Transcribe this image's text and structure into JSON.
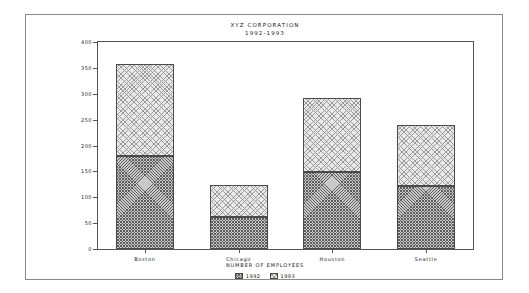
{
  "chart_data": {
    "type": "bar",
    "subtype": "stacked-vertical-bar",
    "title": "XYZ CORPORATION",
    "subtitle": "1992-1993",
    "xlabel": "NUMBER OF EMPLOYEES",
    "ylabel": "",
    "categories": [
      "Boston",
      "Chicago",
      "Houston",
      "Seattle"
    ],
    "series": [
      {
        "name": "1992",
        "values": [
          180,
          62,
          148,
          122
        ],
        "fill": "dense-crosshatch",
        "color": "#c9c9c9"
      },
      {
        "name": "1993",
        "values": [
          177,
          62,
          144,
          118
        ],
        "fill": "light-crosshatch",
        "color": "#e9e9e9"
      }
    ],
    "totals": [
      357,
      124,
      292,
      240
    ],
    "ylim": [
      0,
      400
    ],
    "yticks": [
      0,
      50,
      100,
      150,
      200,
      250,
      300,
      350,
      400
    ],
    "ytick_labels": [
      "0",
      "50",
      "100",
      "150",
      "200",
      "250",
      "300",
      "350",
      "400"
    ],
    "grid": false,
    "legend_position": "bottom-center",
    "legend_entries": [
      "1992",
      "1993"
    ]
  },
  "frame": {
    "border_color": "#8a8a8a",
    "plot_border_color": "#555555"
  }
}
